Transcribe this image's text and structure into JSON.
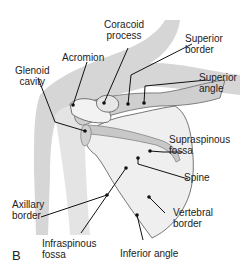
{
  "figure": {
    "panel_letter": "B",
    "colors": {
      "body_shadow": "#d4d4d4",
      "bone_fill": "#ececec",
      "bone_shade": "#c9c9c9",
      "outline": "#555555",
      "leader": "#111111"
    }
  },
  "labels": {
    "coracoid_process": [
      "Coracoid",
      "process"
    ],
    "acromion": [
      "Acromion"
    ],
    "glenoid_cavity": [
      "Glenoid",
      "cavity"
    ],
    "superior_border": [
      "Superior",
      "border"
    ],
    "superior_angle": [
      "Superior",
      "angle"
    ],
    "supraspinous_fossa": [
      "Supraspinous",
      "fossa"
    ],
    "spine": [
      "Spine"
    ],
    "axillary_border": [
      "Axillary",
      "border"
    ],
    "vertebral_border": [
      "Vertebral",
      "border"
    ],
    "infraspinous_fossa": [
      "Infraspinous",
      "fossa"
    ],
    "inferior_angle": [
      "Inferior angle"
    ]
  }
}
